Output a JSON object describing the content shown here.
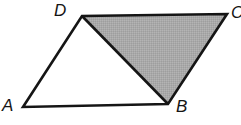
{
  "figure": {
    "name": "parallelogram-with-shaded-triangle",
    "width": 241,
    "height": 125,
    "background_color": "#ffffff",
    "stroke_color": "#151515",
    "stroke_width": 2.6,
    "shade_fill_color": "#a9a9a9",
    "shade_texture": "dithered-checkerboard",
    "vertices": [
      {
        "id": "A",
        "label": "A",
        "x": 23,
        "y": 107,
        "label_x": 2,
        "label_y": 97
      },
      {
        "id": "B",
        "label": "B",
        "x": 168,
        "y": 104,
        "label_x": 176,
        "label_y": 98
      },
      {
        "id": "C",
        "label": "C",
        "x": 227,
        "y": 14,
        "label_x": 231,
        "label_y": 4
      },
      {
        "id": "D",
        "label": "D",
        "x": 82,
        "y": 16,
        "label_x": 54,
        "label_y": 2
      }
    ],
    "outline_polygon": "23,107 82,16 227,14 168,104",
    "shaded_polygon": "82,16 227,14 168,104",
    "diagonal_segment": {
      "from": "D",
      "to": "B",
      "x1": 82,
      "y1": 16,
      "x2": 168,
      "y2": 104
    },
    "edges": [
      {
        "id": "AD",
        "from": "A",
        "to": "D"
      },
      {
        "id": "DC",
        "from": "D",
        "to": "C"
      },
      {
        "id": "CB",
        "from": "C",
        "to": "B"
      },
      {
        "id": "BA",
        "from": "B",
        "to": "A"
      }
    ]
  }
}
